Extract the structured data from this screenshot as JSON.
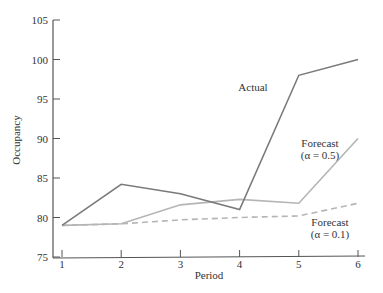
{
  "chart_data": {
    "type": "line",
    "title": "",
    "xlabel": "Period",
    "ylabel": "Occupancy",
    "x": [
      1,
      2,
      3,
      4,
      5,
      6
    ],
    "xticks": [
      "1",
      "2",
      "3",
      "4",
      "5",
      "6"
    ],
    "yticks": [
      "75",
      "80",
      "85",
      "90",
      "95",
      "100",
      "105"
    ],
    "ylim": [
      75,
      105
    ],
    "xlim": [
      1,
      6
    ],
    "grid": false,
    "legend": "inline annotations",
    "series": [
      {
        "name": "Actual",
        "label": "Actual",
        "style": "solid",
        "color": "#7a7a7a",
        "values": [
          79,
          84.2,
          83,
          81,
          98,
          100
        ]
      },
      {
        "name": "Forecast (α = 0.5)",
        "label_line1": "Forecast",
        "label_line2": "(α = 0.5)",
        "style": "solid",
        "color": "#b5b5b5",
        "values": [
          79,
          79.2,
          81.6,
          82.3,
          81.8,
          90
        ]
      },
      {
        "name": "Forecast (α = 0.1)",
        "label_line1": "Forecast",
        "label_line2": "(α = 0.1)",
        "style": "dashed",
        "color": "#b5b5b5",
        "values": [
          79,
          79.2,
          79.7,
          80.0,
          80.2,
          81.8
        ]
      }
    ]
  }
}
